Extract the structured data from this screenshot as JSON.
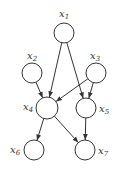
{
  "diagram": {
    "type": "directed-acyclic-graph",
    "nodes": [
      {
        "id": "x1",
        "base": "x",
        "sub": "1",
        "cx": 64,
        "cy": 33,
        "r": 10,
        "lx": 59,
        "ly": 17
      },
      {
        "id": "x2",
        "base": "x",
        "sub": "2",
        "cx": 32,
        "cy": 73,
        "r": 10,
        "lx": 27,
        "ly": 59
      },
      {
        "id": "x3",
        "base": "x",
        "sub": "3",
        "cx": 96,
        "cy": 73,
        "r": 10,
        "lx": 90,
        "ly": 59
      },
      {
        "id": "x4",
        "base": "x",
        "sub": "4",
        "cx": 47,
        "cy": 108,
        "r": 11,
        "lx": 23,
        "ly": 110
      },
      {
        "id": "x5",
        "base": "x",
        "sub": "5",
        "cx": 86,
        "cy": 108,
        "r": 10,
        "lx": 99,
        "ly": 112
      },
      {
        "id": "x6",
        "base": "x",
        "sub": "6",
        "cx": 34,
        "cy": 150,
        "r": 10,
        "lx": 10,
        "ly": 153
      },
      {
        "id": "x7",
        "base": "x",
        "sub": "7",
        "cx": 85,
        "cy": 150,
        "r": 10,
        "lx": 98,
        "ly": 154
      }
    ],
    "edges": [
      {
        "from": "x1",
        "to": "x4"
      },
      {
        "from": "x1",
        "to": "x5"
      },
      {
        "from": "x2",
        "to": "x4"
      },
      {
        "from": "x3",
        "to": "x4"
      },
      {
        "from": "x3",
        "to": "x5"
      },
      {
        "from": "x4",
        "to": "x6"
      },
      {
        "from": "x4",
        "to": "x7"
      },
      {
        "from": "x5",
        "to": "x7"
      }
    ],
    "colors": {
      "stroke": "#333333",
      "fill": "#ffffff",
      "background": "#ffffff"
    }
  }
}
